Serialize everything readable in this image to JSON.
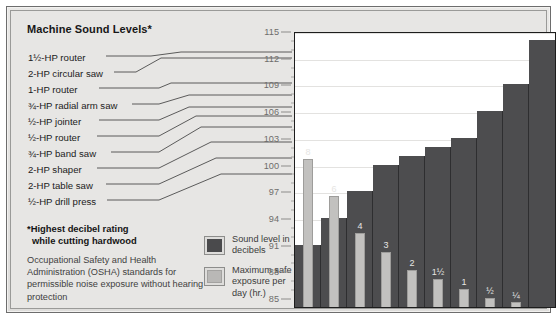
{
  "title": "Machine Sound Levels*",
  "machine_labels": [
    "1½-HP router",
    "2-HP circular saw",
    "1-HP router",
    "¾-HP radial arm saw",
    "½-HP jointer",
    "½-HP router",
    "¾-HP band saw",
    "2-HP shaper",
    "2-HP table saw",
    "½-HP drill press"
  ],
  "footnote": {
    "line1": "*Highest decibel rating",
    "line2": "while cutting hardwood"
  },
  "osha_note": "Occupational Safety and Health Administration (OSHA) standards for permissible noise exposure without hearing protection",
  "legend": [
    {
      "swatch": "dark",
      "text": "Sound level in decibels"
    },
    {
      "swatch": "light",
      "text": "Maximum safe exposure per day (hr.)"
    }
  ],
  "chart_data": {
    "type": "bar",
    "title": "Machine Sound Levels*",
    "xlabel": "",
    "ylabel": "",
    "ylim": [
      84,
      115
    ],
    "grid": true,
    "legend_position": "left-panel",
    "y_ticks": [
      115,
      112,
      109,
      106,
      103,
      100,
      97,
      94,
      91,
      88,
      85
    ],
    "categories": [
      "½-HP drill press",
      "2-HP table saw",
      "2-HP shaper",
      "¾-HP band saw",
      "½-HP router",
      "½-HP jointer",
      "¾-HP radial arm saw",
      "1-HP router",
      "2-HP circular saw",
      "1½-HP router"
    ],
    "series": [
      {
        "name": "Sound level in decibels",
        "color": "#4d4d4f",
        "values": [
          91,
          94,
          97,
          100,
          101,
          102,
          103,
          106,
          109,
          114
        ]
      },
      {
        "name": "Maximum safe exposure per day (hr.)",
        "color": "#c2c1bf",
        "unit": "hours",
        "values": [
          8,
          6,
          4,
          3,
          2,
          1.5,
          1,
          0.5,
          0.25,
          0
        ],
        "labels": [
          "8",
          "6",
          "4",
          "3",
          "2",
          "1½",
          "1",
          "½",
          "¼",
          ""
        ]
      }
    ]
  }
}
